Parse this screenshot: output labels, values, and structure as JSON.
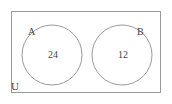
{
  "diagram": {
    "type": "venn",
    "canvas": {
      "width": 172,
      "height": 104,
      "background": "#ffffff"
    },
    "stroke_color": "#9a9a9a",
    "text_color": "#444444",
    "universe": {
      "label": "U",
      "shape": "rectangle",
      "x": 11,
      "y": 11,
      "width": 150,
      "height": 82
    },
    "sets": [
      {
        "label": "A",
        "count": "24",
        "shape": "circle",
        "cx": 52,
        "cy": 55,
        "r": 30,
        "label_position": "upper-left"
      },
      {
        "label": "B",
        "count": "12",
        "shape": "circle",
        "cx": 122,
        "cy": 55,
        "r": 30,
        "label_position": "upper-right"
      }
    ],
    "intersection": {
      "present": false,
      "count": null
    }
  }
}
